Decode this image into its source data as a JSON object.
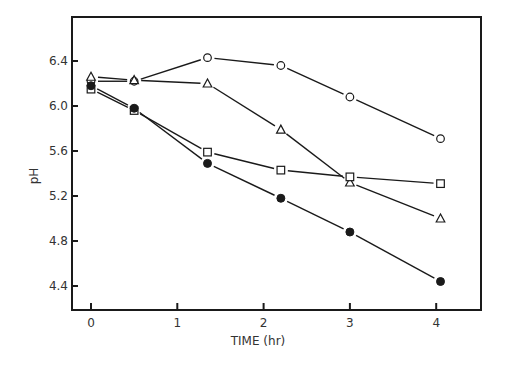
{
  "chart_data": {
    "type": "line",
    "title": "",
    "xlabel": "TIME (hr)",
    "ylabel": "pH",
    "xlim": [
      -0.25,
      4.45
    ],
    "ylim": [
      4.2,
      6.75
    ],
    "xticks": [
      0,
      1,
      2,
      3,
      4
    ],
    "xtick_labels": [
      "0",
      "1",
      "2",
      "3",
      "4"
    ],
    "yticks": [
      4.4,
      4.8,
      5.2,
      5.6,
      6.0,
      6.4
    ],
    "ytick_labels": [
      "4.4",
      "4.8",
      "5.2",
      "5.6",
      "6.0",
      "6.4"
    ],
    "grid": false,
    "legend": "none",
    "series": [
      {
        "name": "open-circle",
        "marker": "circle-open",
        "x": [
          0,
          0.5,
          1.35,
          2.2,
          3.0,
          4.05
        ],
        "y": [
          6.22,
          6.22,
          6.43,
          6.36,
          6.08,
          5.71
        ]
      },
      {
        "name": "open-triangle",
        "marker": "triangle-open",
        "x": [
          0,
          0.5,
          1.35,
          2.2,
          3.0,
          4.05
        ],
        "y": [
          6.26,
          6.23,
          6.2,
          5.79,
          5.32,
          5.0
        ]
      },
      {
        "name": "open-square",
        "marker": "square-open",
        "x": [
          0,
          0.5,
          1.35,
          2.2,
          3.0,
          4.05
        ],
        "y": [
          6.15,
          5.96,
          5.59,
          5.43,
          5.37,
          5.31
        ]
      },
      {
        "name": "filled-circle",
        "marker": "circle-filled",
        "x": [
          0,
          0.5,
          1.35,
          2.2,
          3.0,
          4.05
        ],
        "y": [
          6.18,
          5.98,
          5.49,
          5.18,
          4.88,
          4.44
        ]
      }
    ]
  },
  "colors": {
    "ink": "#1a1a1a",
    "background": "#ffffff"
  }
}
